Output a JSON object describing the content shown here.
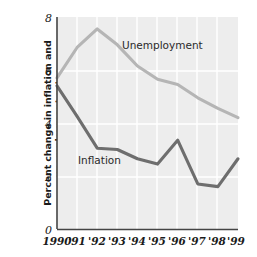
{
  "chart_data": {
    "type": "line",
    "title": "",
    "xlabel": "",
    "ylabel": "Percent change in inflation and unemployment rates",
    "x": [
      1990,
      1991,
      1992,
      1993,
      1994,
      1995,
      1996,
      1997,
      1998,
      1999
    ],
    "categories": [
      "1990",
      "'91",
      "'92",
      "'93",
      "'94",
      "'95",
      "'96",
      "'97",
      "'98",
      "'99"
    ],
    "ylim": [
      0,
      8
    ],
    "yticks": [
      0,
      2,
      4,
      6,
      8
    ],
    "ytick_labels": [
      "0",
      "2",
      "4",
      "6",
      "8"
    ],
    "grid": true,
    "grid_color": "#ffffff",
    "plot_background": "#ededed",
    "legend_position": "inline-annotations",
    "series": [
      {
        "name": "Unemployment",
        "color": "#b5b5b5",
        "values": [
          5.7,
          6.85,
          7.55,
          6.95,
          6.15,
          5.65,
          5.45,
          4.95,
          4.55,
          4.2
        ]
      },
      {
        "name": "Inflation",
        "color": "#6e6e6e",
        "values": [
          5.4,
          4.25,
          3.05,
          3.0,
          2.65,
          2.45,
          3.35,
          1.7,
          1.6,
          2.65
        ]
      }
    ],
    "annotations": [
      {
        "text": "Unemployment",
        "x_value": 1993.2,
        "y_value": 6.9
      },
      {
        "text": "Inflation",
        "x_value": 1991.15,
        "y_value": 2.05
      }
    ]
  }
}
